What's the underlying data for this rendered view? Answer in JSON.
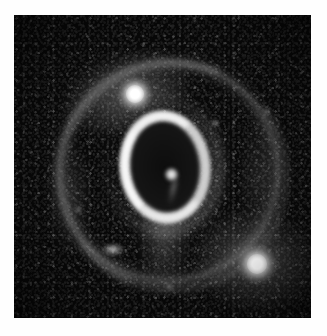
{
  "figure": {
    "kind": "astronomical-image",
    "caption": "",
    "background_color": "#ffffff",
    "sky_color": "#050505",
    "frame": {
      "left": 14,
      "top": 15,
      "width": 297,
      "height": 303
    }
  },
  "features": {
    "inner_ring": {
      "name": "inner-equatorial-ring",
      "shape": "ellipse",
      "center": [
        151,
        152
      ],
      "width": 90,
      "height": 112,
      "position_angle_deg": -6,
      "brightest_side": "left",
      "color": "#dedede"
    },
    "outer_ring": {
      "name": "outer-faint-ring",
      "shape": "circle",
      "center": [
        155,
        157
      ],
      "diameter": 225,
      "color": "#8e8e8e"
    },
    "central_knot": {
      "name": "central-knot",
      "center": [
        157,
        159
      ],
      "color": "#f2f2f2"
    },
    "stars": [
      {
        "id": "star-2",
        "center": [
          121,
          79
        ],
        "brightness": "bright",
        "color": "#ffffff"
      },
      {
        "id": "star-3",
        "center": [
          243,
          249
        ],
        "brightness": "bright",
        "color": "#ffffff"
      },
      {
        "id": "star-faint-lower-left",
        "center": [
          99,
          234
        ],
        "brightness": "faint",
        "color": "#e1e1e1"
      },
      {
        "id": "star-faint-upper-right",
        "center": [
          201,
          108
        ],
        "brightness": "faint",
        "color": "#c8c8c8"
      },
      {
        "id": "star-faint-left",
        "center": [
          64,
          194
        ],
        "brightness": "faint",
        "color": "#bebebe"
      },
      {
        "id": "star-faint-right",
        "center": [
          252,
          96
        ],
        "brightness": "faint",
        "color": "#b9b9b9"
      },
      {
        "id": "star-faint-bottom",
        "center": [
          155,
          272
        ],
        "brightness": "faint",
        "color": "#bebebe"
      }
    ],
    "nebulosity": [
      {
        "id": "nebulosity-upper-left",
        "center": [
          112,
          77
        ]
      },
      {
        "id": "nebulosity-lower-right",
        "center": [
          243,
          246
        ]
      },
      {
        "id": "nebulosity-southern-tail",
        "center": [
          150,
          232
        ]
      }
    ]
  },
  "accessibility": {
    "alt_text": "Grayscale astronomical image of a ring-shaped nebula with a bright inner elliptical ring, a large faint outer ring, and two bright foreground stars."
  }
}
